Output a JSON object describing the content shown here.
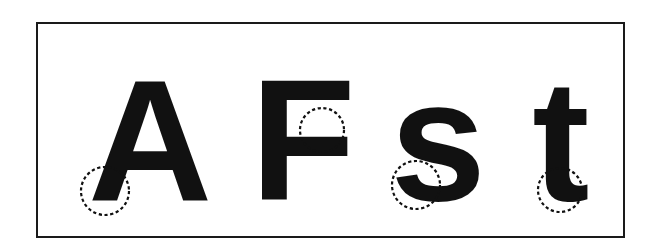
{
  "figure": {
    "title": "Letterform terminal features",
    "background_color": "#ffffff",
    "frame": {
      "border_color": "#1a1a1a",
      "border_width": 2,
      "fill_color": "#ffffff",
      "x": 36,
      "y": 22,
      "width": 589,
      "height": 216
    },
    "ink_color": "#111111",
    "marker_color": "#111111",
    "glyphs": [
      {
        "id": "glyph-a",
        "character": "A",
        "label": "uppercase-a",
        "x": 150,
        "baseline": 200,
        "font_size": 172,
        "font_weight": "bold",
        "font_style": "normal"
      },
      {
        "id": "glyph-f",
        "character": "F",
        "label": "uppercase-f",
        "x": 303,
        "baseline": 200,
        "font_size": 172,
        "font_weight": "bold",
        "font_style": "normal"
      },
      {
        "id": "glyph-s",
        "character": "s",
        "label": "lowercase-s",
        "x": 438,
        "baseline": 200,
        "font_size": 172,
        "font_weight": "bold",
        "font_style": "normal"
      },
      {
        "id": "glyph-t",
        "character": "t",
        "label": "lowercase-t",
        "x": 561,
        "baseline": 200,
        "font_size": 172,
        "font_weight": "bold",
        "font_style": "normal"
      }
    ],
    "markers": [
      {
        "id": "marker-a",
        "label": "marker-on-uppercase-a",
        "target": "A",
        "cx": 105,
        "cy": 191,
        "r": 24,
        "style": "dashed-circle"
      },
      {
        "id": "marker-f",
        "label": "marker-on-uppercase-f",
        "target": "F",
        "cx": 322,
        "cy": 130,
        "r": 22,
        "style": "dashed-circle"
      },
      {
        "id": "marker-s",
        "label": "marker-on-lowercase-s",
        "target": "s",
        "cx": 416,
        "cy": 185,
        "r": 24,
        "style": "dashed-circle"
      },
      {
        "id": "marker-t",
        "label": "marker-on-lowercase-t",
        "target": "t",
        "cx": 560,
        "cy": 190,
        "r": 22,
        "style": "dashed-circle"
      }
    ]
  }
}
